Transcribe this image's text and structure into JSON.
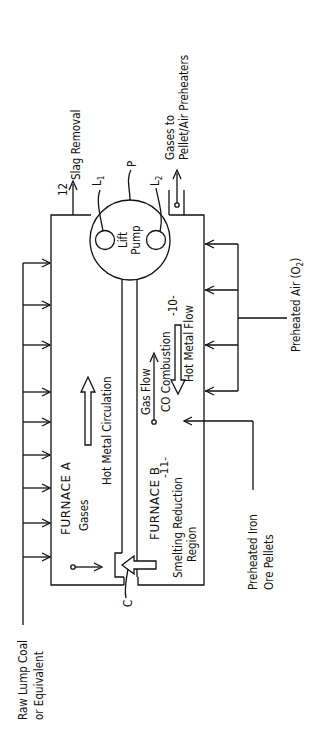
{
  "diagram": {
    "furnace_a": {
      "label": "FURNACE  A",
      "gases": "Gases"
    },
    "furnace_b": {
      "label": "FURNACE  B",
      "ref": "-11-",
      "region_line1": "Smelting  Reduction",
      "region_line2": "Region"
    },
    "circulation": {
      "label": "Hot Metal Circulation"
    },
    "pump": {
      "line1": "Lift",
      "line2": "Pump",
      "ref_p": "P",
      "ref_l1": "L",
      "ref_l1_sub": "1",
      "ref_l2": "L",
      "ref_l2_sub": "2"
    },
    "slag": {
      "ref": "12",
      "label": "Slag Removal"
    },
    "gas_out": {
      "line1": "Gases to",
      "line2": "Pellet/Air Preheaters"
    },
    "air": {
      "label": "Preheated Air  (O",
      "sub": "2",
      "close": ")"
    },
    "hot_metal_flow": {
      "ref": "-10-",
      "label": "Hot Metal Flow"
    },
    "gas_flow": {
      "label": "Gas Flow",
      "combustion": "CO Combustion"
    },
    "iron_ore": {
      "line1": "Preheated Iron",
      "line2": "Ore Pellets"
    },
    "coal": {
      "line1": "Raw Lump Coal",
      "line2": "or Equivalent"
    },
    "channel_ref": "C"
  }
}
